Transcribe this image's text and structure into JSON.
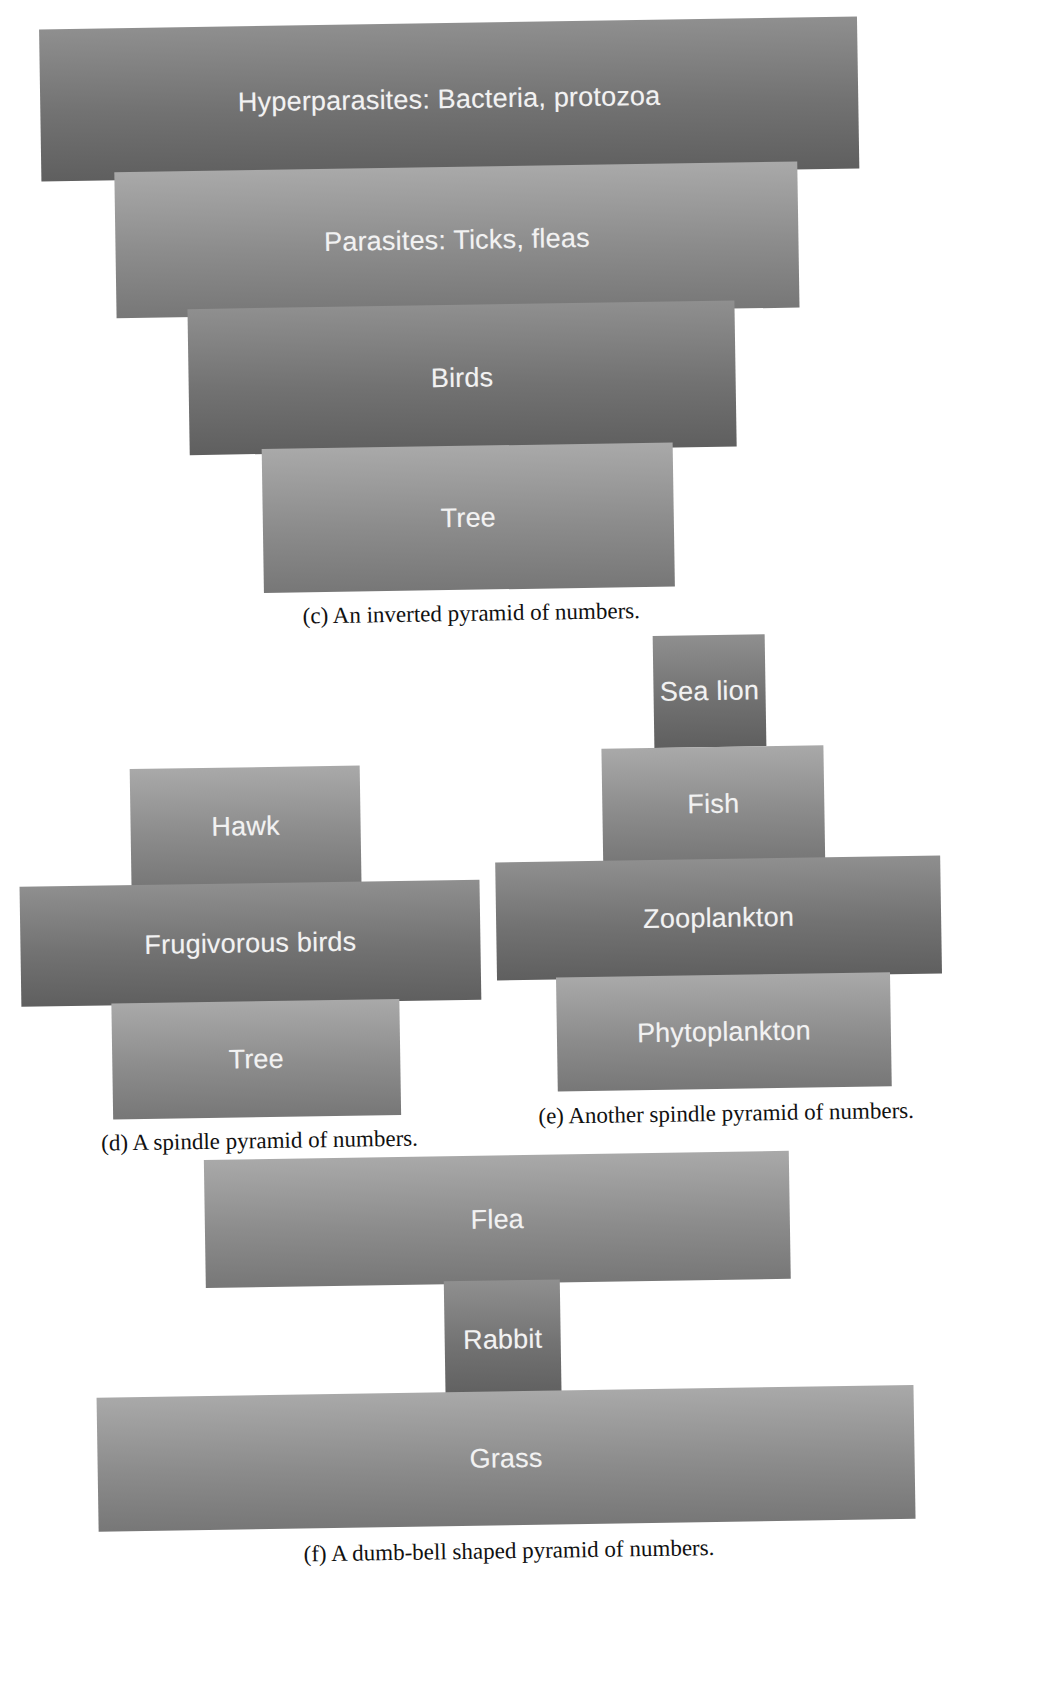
{
  "figures": {
    "c": {
      "caption": "(c) An inverted pyramid of numbers.",
      "levels": [
        {
          "label": "Hyperparasites: Bacteria, protozoa",
          "shade": "dark"
        },
        {
          "label": "Parasites: Ticks, fleas",
          "shade": "light"
        },
        {
          "label": "Birds",
          "shade": "dark"
        },
        {
          "label": "Tree",
          "shade": "light"
        }
      ]
    },
    "d": {
      "caption": "(d) A spindle pyramid of numbers.",
      "levels": [
        {
          "label": "Hawk",
          "shade": "light"
        },
        {
          "label": "Frugivorous birds",
          "shade": "dark"
        },
        {
          "label": "Tree",
          "shade": "light"
        }
      ]
    },
    "e": {
      "caption": "(e) Another spindle pyramid of numbers.",
      "levels": [
        {
          "label": "Sea lion",
          "shade": "dark"
        },
        {
          "label": "Fish",
          "shade": "light"
        },
        {
          "label": "Zooplankton",
          "shade": "dark"
        },
        {
          "label": "Phytoplankton",
          "shade": "light"
        }
      ]
    },
    "f": {
      "caption": "(f) A dumb-bell shaped pyramid of numbers.",
      "levels": [
        {
          "label": "Flea",
          "shade": "light"
        },
        {
          "label": "Rabbit",
          "shade": "dark"
        },
        {
          "label": "Grass",
          "shade": "light"
        }
      ]
    }
  },
  "colors": {
    "dark_top": "#8f8f8f",
    "dark_bottom": "#5f5f5f",
    "light_top": "#a9a9a9",
    "light_bottom": "#777777",
    "label_text": "#f2f2f2",
    "caption_text": "#111111"
  }
}
